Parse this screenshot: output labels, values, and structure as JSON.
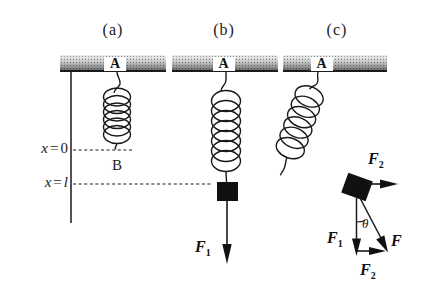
{
  "figure_type": "physics-spring-diagram",
  "colors": {
    "ink": "#1a1a1a",
    "mass_fill": "#111111",
    "ceiling_light": "#f0f0f0",
    "ceiling_dark": "#6b6b6b",
    "background": "#ffffff"
  },
  "panels": {
    "a": {
      "label": "(a)",
      "anchor_top": "A",
      "anchor_bottom": "B"
    },
    "b": {
      "label": "(b)",
      "anchor_top": "A",
      "f1": {
        "base": "F",
        "sub": "1"
      }
    },
    "c": {
      "label": "(c)",
      "anchor_top": "A",
      "f2_top": {
        "base": "F",
        "sub": "2"
      },
      "f1": {
        "base": "F",
        "sub": "1"
      },
      "f": {
        "base": "F"
      },
      "f2_bottom": {
        "base": "F",
        "sub": "2"
      },
      "angle": "θ"
    }
  },
  "axis": {
    "x_zero": {
      "var": "x",
      "eq": "=",
      "val": "0"
    },
    "x_l": {
      "var": "x",
      "eq": "=",
      "val": "l"
    }
  }
}
